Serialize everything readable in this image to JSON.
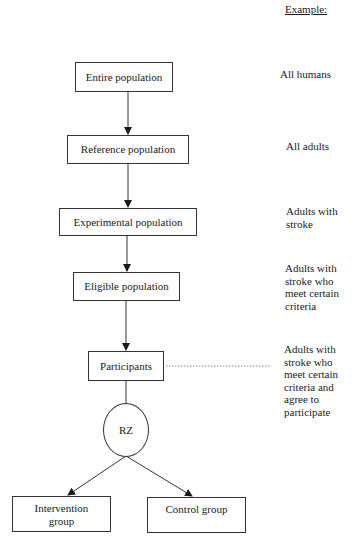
{
  "header": {
    "example_label": "Example:"
  },
  "flow": {
    "nodes": [
      {
        "id": "entire",
        "label": "Entire population"
      },
      {
        "id": "reference",
        "label": "Reference population"
      },
      {
        "id": "experimental",
        "label": "Experimental population"
      },
      {
        "id": "eligible",
        "label": "Eligible population"
      },
      {
        "id": "participants",
        "label": "Participants"
      },
      {
        "id": "rz",
        "label": "RZ"
      },
      {
        "id": "intervention",
        "label": "Intervention\ngroup"
      },
      {
        "id": "control",
        "label": "Control group"
      }
    ],
    "edges": [
      {
        "from": "entire",
        "to": "reference"
      },
      {
        "from": "reference",
        "to": "experimental"
      },
      {
        "from": "experimental",
        "to": "eligible"
      },
      {
        "from": "eligible",
        "to": "participants"
      },
      {
        "from": "participants",
        "to": "rz"
      },
      {
        "from": "rz",
        "to": "intervention"
      },
      {
        "from": "rz",
        "to": "control"
      }
    ]
  },
  "examples": [
    {
      "for": "entire",
      "text": "All humans"
    },
    {
      "for": "reference",
      "text": "All adults"
    },
    {
      "for": "experimental",
      "text": "Adults with\nstroke"
    },
    {
      "for": "eligible",
      "text": "Adults with\nstroke who\nmeet certain\ncriteria"
    },
    {
      "for": "participants",
      "text": "Adults with\nstroke who\nmeet certain\ncriteria and\nagree to\nparticipate"
    }
  ],
  "colors": {
    "line": "#333333",
    "text": "#1a1a1a",
    "dashed_connector": "#888888"
  }
}
